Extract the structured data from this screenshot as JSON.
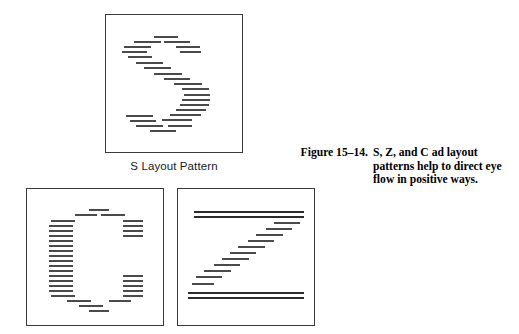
{
  "figure": {
    "caption_label": "Figure 15–14.",
    "caption_text": "S, Z, and C ad layout patterns help to direct eye flow in positive ways.",
    "line_color": "#4a4a4a",
    "border_color": "#3a3a3a",
    "background": "#ffffff"
  },
  "panels": [
    {
      "id": "s",
      "name": "S Layout Pattern",
      "label": "S Layout Pattern",
      "has_label": true,
      "box": {
        "x": 105,
        "y": 14,
        "w": 138,
        "h": 139
      },
      "description": "Simulated body-copy rules arranged in an S-shaped eye-flow path",
      "marks": [
        {
          "x": 48,
          "y": 21,
          "w": 24
        },
        {
          "x": 28,
          "y": 26,
          "w": 27
        },
        {
          "x": 58,
          "y": 26,
          "w": 26
        },
        {
          "x": 18,
          "y": 31,
          "w": 27
        },
        {
          "x": 70,
          "y": 31,
          "w": 24
        },
        {
          "x": 16,
          "y": 36,
          "w": 25
        },
        {
          "x": 74,
          "y": 36,
          "w": 21
        },
        {
          "x": 22,
          "y": 41,
          "w": 24
        },
        {
          "x": 30,
          "y": 47,
          "w": 27
        },
        {
          "x": 38,
          "y": 52,
          "w": 27
        },
        {
          "x": 48,
          "y": 58,
          "w": 28
        },
        {
          "x": 58,
          "y": 63,
          "w": 26
        },
        {
          "x": 68,
          "y": 68,
          "w": 28
        },
        {
          "x": 76,
          "y": 73,
          "w": 27
        },
        {
          "x": 78,
          "y": 79,
          "w": 26
        },
        {
          "x": 76,
          "y": 84,
          "w": 28
        },
        {
          "x": 74,
          "y": 89,
          "w": 29
        },
        {
          "x": 70,
          "y": 94,
          "w": 30
        },
        {
          "x": 64,
          "y": 99,
          "w": 31
        },
        {
          "x": 20,
          "y": 100,
          "w": 27
        },
        {
          "x": 56,
          "y": 104,
          "w": 30
        },
        {
          "x": 24,
          "y": 105,
          "w": 26
        },
        {
          "x": 30,
          "y": 110,
          "w": 27
        },
        {
          "x": 62,
          "y": 110,
          "w": 24
        },
        {
          "x": 44,
          "y": 115,
          "w": 26
        }
      ]
    },
    {
      "id": "c",
      "name": "C Layout Pattern",
      "label": "",
      "has_label": false,
      "box": {
        "x": 26,
        "y": 188,
        "w": 138,
        "h": 138
      },
      "description": "Simulated body-copy rules arranged in a C-shaped eye-flow path",
      "marks": [
        {
          "x": 62,
          "y": 20,
          "w": 20
        },
        {
          "x": 48,
          "y": 25,
          "w": 22
        },
        {
          "x": 74,
          "y": 25,
          "w": 24
        },
        {
          "x": 24,
          "y": 31,
          "w": 24
        },
        {
          "x": 96,
          "y": 31,
          "w": 20
        },
        {
          "x": 22,
          "y": 36,
          "w": 24
        },
        {
          "x": 96,
          "y": 36,
          "w": 20
        },
        {
          "x": 22,
          "y": 41,
          "w": 24
        },
        {
          "x": 96,
          "y": 41,
          "w": 20
        },
        {
          "x": 22,
          "y": 46,
          "w": 24
        },
        {
          "x": 96,
          "y": 46,
          "w": 20
        },
        {
          "x": 22,
          "y": 51,
          "w": 24
        },
        {
          "x": 22,
          "y": 56,
          "w": 24
        },
        {
          "x": 22,
          "y": 61,
          "w": 24
        },
        {
          "x": 22,
          "y": 66,
          "w": 24
        },
        {
          "x": 22,
          "y": 71,
          "w": 24
        },
        {
          "x": 22,
          "y": 76,
          "w": 24
        },
        {
          "x": 22,
          "y": 81,
          "w": 24
        },
        {
          "x": 22,
          "y": 86,
          "w": 24
        },
        {
          "x": 96,
          "y": 86,
          "w": 20
        },
        {
          "x": 22,
          "y": 91,
          "w": 24
        },
        {
          "x": 96,
          "y": 91,
          "w": 20
        },
        {
          "x": 22,
          "y": 96,
          "w": 24
        },
        {
          "x": 96,
          "y": 96,
          "w": 20
        },
        {
          "x": 22,
          "y": 101,
          "w": 24
        },
        {
          "x": 96,
          "y": 101,
          "w": 20
        },
        {
          "x": 24,
          "y": 106,
          "w": 24
        },
        {
          "x": 96,
          "y": 106,
          "w": 20
        },
        {
          "x": 40,
          "y": 111,
          "w": 24
        },
        {
          "x": 82,
          "y": 111,
          "w": 22
        },
        {
          "x": 52,
          "y": 116,
          "w": 24
        },
        {
          "x": 62,
          "y": 121,
          "w": 20
        }
      ]
    },
    {
      "id": "z",
      "name": "Z Layout Pattern",
      "label": "",
      "has_label": false,
      "box": {
        "x": 177,
        "y": 188,
        "w": 138,
        "h": 138
      },
      "description": "Simulated body-copy rules arranged in a Z-shaped eye-flow path",
      "marks": [
        {
          "x": 16,
          "y": 22,
          "w": 110,
          "heavy": true
        },
        {
          "x": 16,
          "y": 27,
          "w": 110,
          "heavy": true
        },
        {
          "x": 96,
          "y": 33,
          "w": 26
        },
        {
          "x": 88,
          "y": 39,
          "w": 26
        },
        {
          "x": 78,
          "y": 45,
          "w": 27
        },
        {
          "x": 70,
          "y": 51,
          "w": 26
        },
        {
          "x": 60,
          "y": 57,
          "w": 27
        },
        {
          "x": 52,
          "y": 63,
          "w": 26
        },
        {
          "x": 44,
          "y": 69,
          "w": 27
        },
        {
          "x": 36,
          "y": 75,
          "w": 26
        },
        {
          "x": 26,
          "y": 81,
          "w": 27
        },
        {
          "x": 18,
          "y": 87,
          "w": 26
        },
        {
          "x": 14,
          "y": 94,
          "w": 22
        },
        {
          "x": 10,
          "y": 103,
          "w": 116,
          "heavy": true
        },
        {
          "x": 10,
          "y": 108,
          "w": 116,
          "heavy": true
        }
      ]
    }
  ]
}
